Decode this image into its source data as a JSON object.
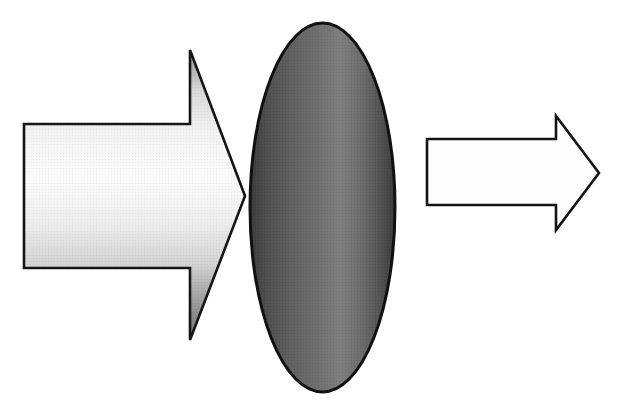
{
  "canvas": {
    "width": 625,
    "height": 408,
    "background_color": "#ffffff",
    "title": "Incident arrow striking absorbing body with attenuated outgoing arrow"
  },
  "figure": {
    "type": "diagram",
    "shape_count": 3
  },
  "shapes": [
    {
      "id": "incoming-arrow",
      "name": "incoming-arrow",
      "kind": "block-arrow",
      "direction": "right",
      "label": "",
      "fill_style": "linear-gradient",
      "fill_stops": [
        "#8f8f8f",
        "#f2f2f2",
        "#fbfbfb",
        "#e3e3e3",
        "#9a9a9a",
        "#6e6e6e"
      ],
      "gradient_angle_deg": 90,
      "stroke_color": "#141414",
      "stroke_width": 2.6,
      "bounds": {
        "x": 24,
        "y": 50,
        "width": 221,
        "height": 290
      },
      "geometry": {
        "tail_left_x": 24,
        "tail_top_y": 124,
        "tail_bottom_y": 268,
        "head_base_x": 190,
        "head_top_y": 50,
        "head_bottom_y": 340,
        "tip_x": 245,
        "tip_y": 196
      }
    },
    {
      "id": "absorber-ellipse",
      "name": "absorber-ellipse",
      "kind": "ellipse",
      "label": "",
      "fill_style": "linear-gradient",
      "fill_stops": [
        "#3d3d3d",
        "#585858",
        "#6b6b6b",
        "#7d7d7d",
        "#6a6a6a",
        "#4a4a4a",
        "#3a3a3a"
      ],
      "gradient_angle_deg": 0,
      "stroke_color": "#111111",
      "stroke_width": 3.0,
      "bounds": {
        "x": 250,
        "y": 23,
        "width": 145,
        "height": 369
      },
      "geometry": {
        "center_x": 322.5,
        "center_y": 207.5,
        "radius_x": 72.5,
        "radius_y": 184.5
      }
    },
    {
      "id": "outgoing-arrow",
      "name": "outgoing-arrow",
      "kind": "block-arrow",
      "direction": "right",
      "label": "",
      "fill_style": "solid",
      "fill_color": "#fdfdfd",
      "stroke_color": "#141414",
      "stroke_width": 2.6,
      "bounds": {
        "x": 427,
        "y": 116,
        "width": 172,
        "height": 114
      },
      "geometry": {
        "tail_left_x": 427,
        "tail_top_y": 139,
        "tail_bottom_y": 205,
        "head_base_x": 556,
        "head_top_y": 116,
        "head_bottom_y": 230,
        "tip_x": 599,
        "tip_y": 173
      }
    }
  ],
  "colors": {
    "background": "#ffffff",
    "outline": "#141414",
    "ellipse_dark": "#3d3d3d",
    "ellipse_light": "#7d7d7d",
    "arrow_light": "#fbfbfb",
    "arrow_shadow": "#6e6e6e"
  },
  "annotations": []
}
